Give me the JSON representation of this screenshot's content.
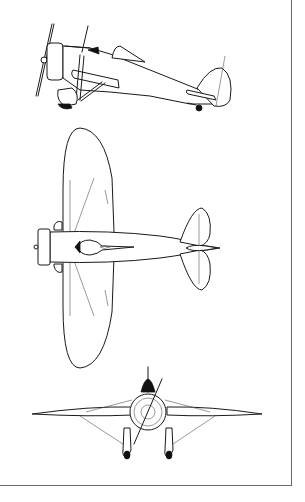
{
  "figure": {
    "views": [
      {
        "id": "side",
        "label": "Side elevation"
      },
      {
        "id": "plan",
        "label": "Plan view"
      },
      {
        "id": "front",
        "label": "Front elevation"
      }
    ],
    "colors": {
      "line": "#1a1a1a",
      "background": "#ffffff",
      "frame": "#6a6a6a"
    }
  }
}
